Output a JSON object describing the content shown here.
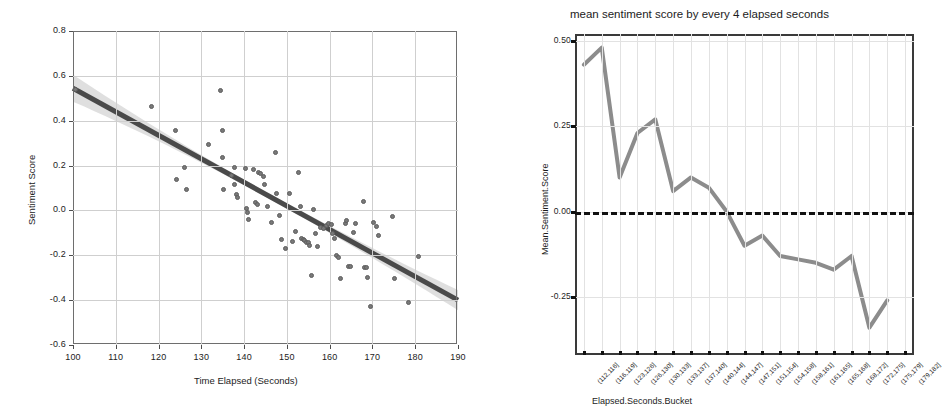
{
  "page": {
    "background": "#ffffff",
    "width": 951,
    "height": 412
  },
  "left_chart": {
    "title": "",
    "x_axis_title": "Time Elapsed (Seconds)",
    "y_axis_title": "Sentiment Score",
    "x_ticks": [
      "100",
      "110",
      "120",
      "130",
      "140",
      "150",
      "160",
      "170",
      "180",
      "190"
    ],
    "y_ticks": [
      "0.8",
      "0.6",
      "0.4",
      "0.2",
      "0.0",
      "-0.2",
      "-0.4",
      "-0.6"
    ],
    "colors": {
      "point": "#787878",
      "fit_line": "#4a4a4a",
      "band": "#d9d9d9",
      "grid": "#cfcfcf",
      "axis": "#6e6e6e"
    }
  },
  "right_chart": {
    "title": "mean sentiment score by every 4 elapsed seconds",
    "x_axis_title": "Elapsed.Seconds.Bucket",
    "y_axis_title": "Mean.Sentiment.Score",
    "y_ticks": [
      "0.50",
      "0.25",
      "0.00",
      "-0.25"
    ],
    "colors": {
      "line": "#8c8c8c",
      "zero_line": "#111111",
      "grid": "#e2e2e2",
      "axis": "#3a3a3a"
    }
  },
  "chart_data": [
    {
      "type": "scatter",
      "title": "",
      "xlabel": "Time Elapsed (Seconds)",
      "ylabel": "Sentiment Score",
      "xlim": [
        100,
        190
      ],
      "ylim": [
        -0.6,
        0.8
      ],
      "xticks": [
        100,
        110,
        120,
        130,
        140,
        150,
        160,
        170,
        180,
        190
      ],
      "yticks": [
        -0.6,
        -0.4,
        -0.2,
        0.0,
        0.2,
        0.4,
        0.6,
        0.8
      ],
      "grid": true,
      "legend": "none",
      "fit": {
        "type": "linear-regression-with-confidence-band",
        "intercept_at_x100": 0.545,
        "value_at_x190": -0.4,
        "slope_per_second": -0.0105,
        "band_halfwidth_at_x100": 0.06,
        "band_halfwidth_at_x145": 0.012,
        "band_halfwidth_at_x190": 0.045
      },
      "points": [
        [
          100.3,
          0.545
        ],
        [
          118.2,
          0.466
        ],
        [
          123.6,
          0.36
        ],
        [
          124.0,
          0.142
        ],
        [
          125.9,
          0.196
        ],
        [
          126.4,
          0.097
        ],
        [
          131.4,
          0.3
        ],
        [
          134.2,
          0.54
        ],
        [
          134.6,
          0.36
        ],
        [
          134.8,
          0.24
        ],
        [
          135.0,
          0.097
        ],
        [
          136.9,
          0.16
        ],
        [
          137.4,
          0.198
        ],
        [
          137.6,
          0.12
        ],
        [
          138.0,
          0.075
        ],
        [
          138.3,
          0.062
        ],
        [
          140.1,
          0.19
        ],
        [
          140.4,
          0.012
        ],
        [
          140.5,
          -0.005
        ],
        [
          140.8,
          -0.035
        ],
        [
          141.9,
          0.185
        ],
        [
          142.4,
          0.04
        ],
        [
          142.8,
          0.032
        ],
        [
          143.1,
          0.175
        ],
        [
          143.6,
          0.168
        ],
        [
          144.2,
          0.158
        ],
        [
          144.6,
          0.122
        ],
        [
          145.3,
          0.024
        ],
        [
          146.2,
          -0.05
        ],
        [
          147.2,
          0.262
        ],
        [
          147.4,
          0.078
        ],
        [
          148.0,
          -0.02
        ],
        [
          148.6,
          -0.125
        ],
        [
          149.4,
          -0.165
        ],
        [
          150.3,
          0.08
        ],
        [
          151.0,
          -0.135
        ],
        [
          151.7,
          -0.09
        ],
        [
          152.4,
          0.175
        ],
        [
          152.9,
          0.02
        ],
        [
          153.1,
          -0.122
        ],
        [
          153.6,
          -0.125
        ],
        [
          153.9,
          -0.13
        ],
        [
          154.4,
          -0.138
        ],
        [
          154.8,
          -0.14
        ],
        [
          155.1,
          -0.152
        ],
        [
          155.4,
          -0.285
        ],
        [
          155.9,
          0.008
        ],
        [
          156.4,
          -0.098
        ],
        [
          157.0,
          -0.155
        ],
        [
          157.6,
          -0.072
        ],
        [
          158.4,
          -0.078
        ],
        [
          159.0,
          -0.062
        ],
        [
          159.4,
          -0.055
        ],
        [
          160.1,
          -0.06
        ],
        [
          160.4,
          -0.098
        ],
        [
          160.8,
          -0.12
        ],
        [
          161.3,
          -0.196
        ],
        [
          161.8,
          -0.205
        ],
        [
          162.3,
          -0.3
        ],
        [
          163.4,
          -0.052
        ],
        [
          163.8,
          -0.04
        ],
        [
          164.2,
          -0.245
        ],
        [
          164.6,
          -0.245
        ],
        [
          165.3,
          -0.092
        ],
        [
          165.9,
          -0.055
        ],
        [
          167.6,
          0.045
        ],
        [
          168.0,
          -0.248
        ],
        [
          168.3,
          -0.252
        ],
        [
          168.6,
          -0.295
        ],
        [
          169.2,
          -0.425
        ],
        [
          170.1,
          -0.05
        ],
        [
          170.6,
          -0.068
        ],
        [
          171.2,
          -0.105
        ],
        [
          174.4,
          -0.022
        ],
        [
          174.9,
          -0.3
        ],
        [
          178.1,
          -0.405
        ],
        [
          180.6,
          -0.2
        ]
      ]
    },
    {
      "type": "line",
      "title": "mean sentiment score by every 4 elapsed seconds",
      "xlabel": "Elapsed.Seconds.Bucket",
      "ylabel": "Mean.Sentiment.Score",
      "ylim": [
        -0.42,
        0.52
      ],
      "yticks": [
        -0.25,
        0.0,
        0.25,
        0.5
      ],
      "ytick_labels": [
        "-0.25",
        "0.00",
        "0.25",
        "0.50"
      ],
      "grid": true,
      "legend": "none",
      "reference_line": {
        "y": 0.0,
        "style": "dashed",
        "color": "#111111"
      },
      "categories": [
        "(112,116]",
        "(116,119]",
        "(123,126]",
        "(126,130]",
        "(130,133]",
        "(133,137]",
        "(137,140]",
        "(140,144]",
        "(144,147]",
        "(147,151]",
        "(151,154]",
        "(154,158]",
        "(158,161]",
        "(161,165]",
        "(165,168]",
        "(168,172]",
        "(172,175]",
        "(175,179]",
        "(179,182]"
      ],
      "values": [
        0.43,
        0.48,
        0.1,
        0.23,
        0.27,
        0.06,
        0.1,
        0.07,
        0.0,
        -0.1,
        -0.07,
        -0.13,
        -0.14,
        -0.15,
        -0.17,
        -0.13,
        -0.34,
        -0.26
      ],
      "series_values_note": "one value per category; last category shares final vertex"
    }
  ]
}
